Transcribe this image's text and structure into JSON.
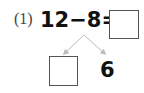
{
  "problem": {
    "number_label": "(1)",
    "expression": "12−8=",
    "answer_box_value": "",
    "decomposition": {
      "left_box_value": "",
      "right_value": "6"
    }
  },
  "colors": {
    "text": "#111111",
    "arrow": "#bbbbbb",
    "box_border": "#555555"
  }
}
